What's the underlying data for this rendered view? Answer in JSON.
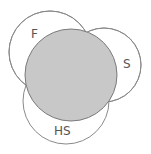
{
  "diagram": {
    "type": "euler",
    "colors": {
      "stroke": "#8a8a8a",
      "center_fill": "#c8c8c8",
      "outer_fill": "#ffffff",
      "label": "#555555"
    },
    "sets": [
      {
        "id": "F",
        "label": "F",
        "cx": 50,
        "cy": 52,
        "r": 41,
        "label_x": 31,
        "label_y": 38
      },
      {
        "id": "S",
        "label": "S",
        "cx": 104,
        "cy": 65,
        "r": 37,
        "label_x": 123,
        "label_y": 68
      },
      {
        "id": "HS",
        "label": "HS",
        "cx": 66,
        "cy": 101,
        "r": 43,
        "label_x": 54,
        "label_y": 135
      }
    ],
    "center": {
      "cx": 71,
      "cy": 75,
      "r": 46,
      "label": ""
    }
  }
}
